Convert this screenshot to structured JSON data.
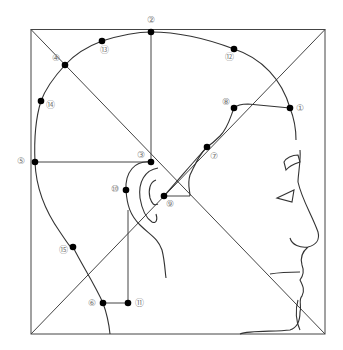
{
  "diagram": {
    "title": "",
    "frame": {
      "x0": 31,
      "y0": 29,
      "x1": 325,
      "y1": 334
    },
    "colors": {
      "line": "#444444",
      "point": "#000000",
      "label": "#777777"
    },
    "points": [
      {
        "id": 1,
        "label": "①",
        "x": 290,
        "y": 108,
        "lx": 300,
        "ly": 108
      },
      {
        "id": 2,
        "label": "②",
        "x": 151,
        "y": 32,
        "lx": 151,
        "ly": 20
      },
      {
        "id": 3,
        "label": "③",
        "x": 151,
        "y": 162,
        "lx": 141,
        "ly": 155
      },
      {
        "id": 4,
        "label": "④",
        "x": 65,
        "y": 65,
        "lx": 56,
        "ly": 58
      },
      {
        "id": 5,
        "label": "⑤",
        "x": 35,
        "y": 162,
        "lx": 21,
        "ly": 161
      },
      {
        "id": 6,
        "label": "⑥",
        "x": 103,
        "y": 303,
        "lx": 92,
        "ly": 303
      },
      {
        "id": 7,
        "label": "⑦",
        "x": 207,
        "y": 147,
        "lx": 214,
        "ly": 156
      },
      {
        "id": 8,
        "label": "⑧",
        "x": 234,
        "y": 108,
        "lx": 226,
        "ly": 102
      },
      {
        "id": 9,
        "label": "⑨",
        "x": 164,
        "y": 196,
        "lx": 170,
        "ly": 204
      },
      {
        "id": 10,
        "label": "⑩",
        "x": 126,
        "y": 190,
        "lx": 115,
        "ly": 189
      },
      {
        "id": 11,
        "label": "⑪",
        "x": 128,
        "y": 303,
        "lx": 139,
        "ly": 303
      },
      {
        "id": 12,
        "label": "⑫",
        "x": 234,
        "y": 49,
        "lx": 229,
        "ly": 57
      },
      {
        "id": 13,
        "label": "⑬",
        "x": 102,
        "y": 41,
        "lx": 104,
        "ly": 50
      },
      {
        "id": 14,
        "label": "⑭",
        "x": 41,
        "y": 101,
        "lx": 50,
        "ly": 105
      },
      {
        "id": 15,
        "label": "⑮",
        "x": 73,
        "y": 247,
        "lx": 63,
        "ly": 250
      }
    ]
  }
}
